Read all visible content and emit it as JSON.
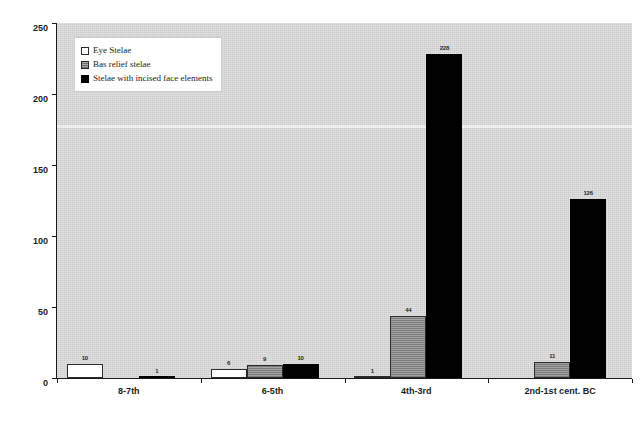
{
  "chart_data": {
    "type": "bar",
    "title": "",
    "subtitle": "",
    "xlabel": "",
    "ylabel": "",
    "ylim": [
      0,
      250
    ],
    "yticks": [
      0,
      50,
      100,
      150,
      200,
      250
    ],
    "grid": false,
    "legend_position": "top-left",
    "categories": [
      "8-7th",
      "6-5th",
      "4th-3rd",
      "2nd-1st cent. BC"
    ],
    "series": [
      {
        "name": "Eye Stelae",
        "swatch": "white",
        "color": "#ffffff",
        "values": [
          10,
          6,
          1,
          0
        ],
        "labels": [
          "10",
          "6",
          "1",
          ""
        ]
      },
      {
        "name": "Bas relief stelae",
        "swatch": "hatched-gray",
        "color": "#8e8e8e",
        "values": [
          0,
          9,
          44,
          11
        ],
        "labels": [
          "",
          "9",
          "44",
          "11"
        ]
      },
      {
        "name": "Stelae with incised face elements",
        "swatch": "black",
        "color": "#000000",
        "values": [
          1,
          10,
          228,
          126
        ],
        "labels": [
          "1",
          "10",
          "228",
          "126"
        ]
      }
    ]
  },
  "legend": {
    "items": [
      {
        "label": "Eye Stelae"
      },
      {
        "label": "Bas relief stelae"
      },
      {
        "label": "Stelae with incised face elements"
      }
    ]
  },
  "axis": {
    "y_tick_labels": [
      "250",
      "200",
      "150",
      "100",
      "50",
      "0"
    ],
    "x_tick_labels": [
      "8-7th",
      "6-5th",
      "4th-3rd",
      "2nd-1st cent. BC"
    ]
  },
  "colors": {
    "plot_background": "#d8d8d8",
    "page_background": "#ffffff",
    "axis": "#1a1a1a",
    "series_1": "#ffffff",
    "series_2": "#8e8e8e",
    "series_3": "#000000"
  }
}
